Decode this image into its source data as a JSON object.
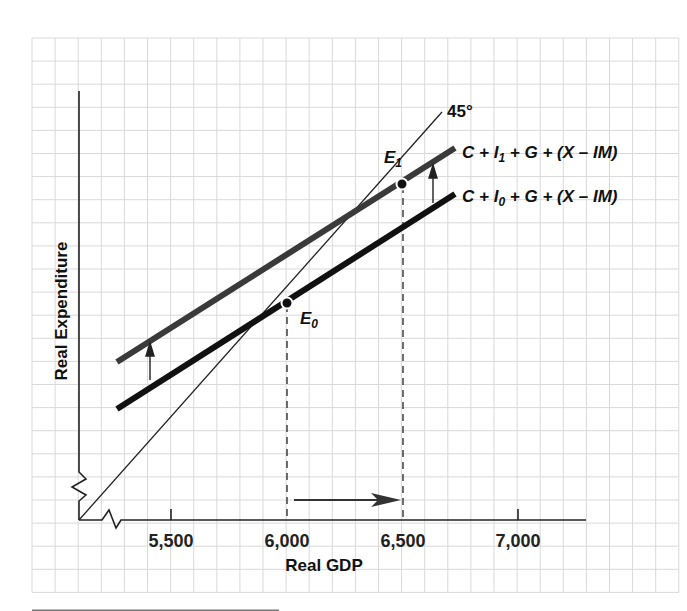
{
  "chart_data": {
    "type": "line",
    "title": "",
    "xlabel": "Real GDP",
    "ylabel": "Real Expenditure",
    "x_ticks": [
      "5,500",
      "6,000",
      "6,500",
      "7,000"
    ],
    "x_tick_values": [
      5500,
      6000,
      6500,
      7000
    ],
    "xlim": [
      5100,
      7300
    ],
    "axis_breaks": [
      "x-axis near origin",
      "y-axis near origin"
    ],
    "grid": true,
    "series": [
      {
        "name": "45° line",
        "label": "45°",
        "style": "thin black",
        "x": [
          5100,
          6850
        ],
        "y_relative": "Y = expenditure"
      },
      {
        "name": "C + I0 + G + (X − IM)",
        "label_parts": [
          "C + I",
          "0",
          " + G + (X – IM)"
        ],
        "style": "thick black",
        "x": [
          5250,
          6720
        ]
      },
      {
        "name": "C + I1 + G + (X − IM)",
        "label_parts": [
          "C + I",
          "1",
          " + G + (X – IM)"
        ],
        "style": "thick dark gray",
        "x": [
          5250,
          6720
        ]
      }
    ],
    "points": [
      {
        "name": "E0",
        "label": "E",
        "sub": "0",
        "x": 6000
      },
      {
        "name": "E1",
        "label": "E",
        "sub": "1",
        "x": 6500
      }
    ],
    "annotations": [
      {
        "type": "arrow",
        "direction": "up",
        "meaning": "upward shift of expenditure schedule (I0 → I1)",
        "count": 2
      },
      {
        "type": "arrow",
        "direction": "right",
        "from_x": 6000,
        "to_x": 6500,
        "meaning": "equilibrium GDP rises from 6,000 to 6,500"
      },
      {
        "type": "dashed-line",
        "x": 6000
      },
      {
        "type": "dashed-line",
        "x": 6500
      }
    ]
  },
  "labels": {
    "y_axis": "Real Expenditure",
    "x_axis": "Real GDP",
    "ticks": [
      "5,500",
      "6,000",
      "6,500",
      "7,000"
    ],
    "angle": "45°",
    "upper_line": {
      "a": "C + I",
      "sub": "1",
      "b": " + G + (X – IM)"
    },
    "lower_line": {
      "a": "C + I",
      "sub": "0",
      "b": " + G + (X – IM)"
    },
    "e0": {
      "main": "E",
      "sub": "0"
    },
    "e1": {
      "main": "E",
      "sub": "1"
    }
  },
  "colors": {
    "grid": "#d9d9d9",
    "axis": "#222222",
    "lower_line": "#111111",
    "upper_line": "#3a3a3a",
    "forty_five": "#222222"
  }
}
